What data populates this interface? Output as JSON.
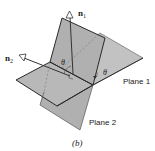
{
  "figure": {
    "caption": "(b)",
    "labels": {
      "normal1": "n",
      "normal1_sub": "1",
      "normal2": "n",
      "normal2_sub": "2",
      "theta_top": "θ",
      "theta_right": "θ",
      "plane1": "Plane 1",
      "plane2": "Plane 2"
    },
    "colors": {
      "plane_fill": "#b3b3b3",
      "plane_fill_back": "#c4c4c4",
      "edge": "#2a2a2a",
      "arrowhead": "#ffffff",
      "background": "#ffffff"
    }
  }
}
